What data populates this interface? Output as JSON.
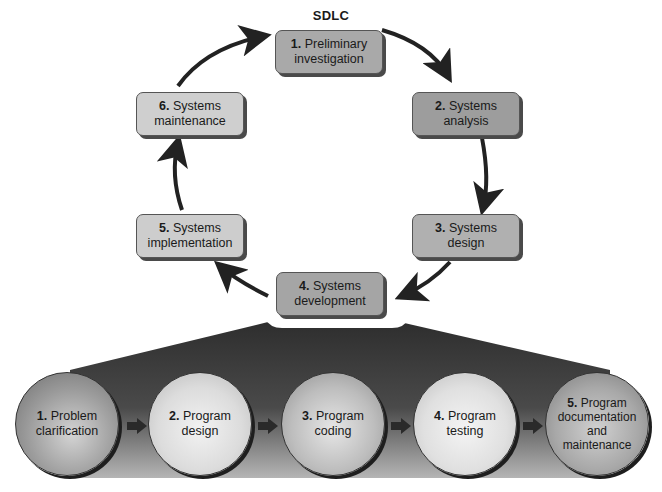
{
  "title": "SDLC",
  "cycle": {
    "steps": [
      {
        "num": "1.",
        "line1": "Preliminary",
        "line2": "investigation",
        "color": "#a9a9a9"
      },
      {
        "num": "2.",
        "line1": "Systems",
        "line2": "analysis",
        "color": "#9d9d9d"
      },
      {
        "num": "3.",
        "line1": "Systems",
        "line2": "design",
        "color": "#b0b0b0"
      },
      {
        "num": "4.",
        "line1": "Systems",
        "line2": "development",
        "color": "#a5a5a5"
      },
      {
        "num": "5.",
        "line1": "Systems",
        "line2": "implementation",
        "color": "#cdcdcd"
      },
      {
        "num": "6.",
        "line1": "Systems",
        "line2": "maintenance",
        "color": "#cfcfcf"
      }
    ]
  },
  "program_steps": {
    "steps": [
      {
        "num": "1.",
        "lines": [
          "Problem",
          "clarification"
        ],
        "color": "#9a9a9a"
      },
      {
        "num": "2.",
        "lines": [
          "Program",
          "design"
        ],
        "color": "#dcdcdc"
      },
      {
        "num": "3.",
        "lines": [
          "Program",
          "coding"
        ],
        "color": "#bdbdbd"
      },
      {
        "num": "4.",
        "lines": [
          "Program",
          "testing"
        ],
        "color": "#e0e0e0"
      },
      {
        "num": "5.",
        "lines": [
          "Program",
          "documentation",
          "and",
          "maintenance"
        ],
        "color": "#a8a8a8"
      }
    ]
  }
}
